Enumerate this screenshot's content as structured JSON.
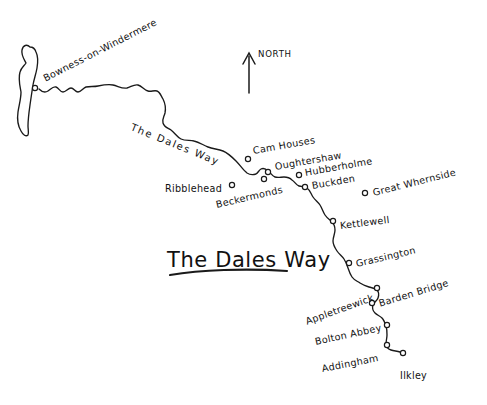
{
  "map": {
    "title": "The Dales Way",
    "route_name_on_path": "The Dales Way",
    "compass": {
      "label": "NORTH",
      "icon": "north-arrow-icon"
    },
    "style": {
      "ink_color": "#1a1a1a",
      "background_color": "#ffffff",
      "marker_fill": "#ffffff"
    },
    "water_features": [
      {
        "name": "Windermere",
        "shape": "elongated-lake-outline"
      }
    ],
    "places": [
      {
        "label": "Bowness-on-Windermere",
        "marker_x": 35,
        "marker_y": 88,
        "text_x": 44,
        "text_y": 74,
        "rotate": -27
      },
      {
        "label": "Cam Houses",
        "marker_x": 248,
        "marker_y": 159,
        "text_x": 253,
        "text_y": 146,
        "rotate": -10
      },
      {
        "label": "Oughtershaw",
        "marker_x": 268,
        "marker_y": 172,
        "text_x": 275,
        "text_y": 162,
        "rotate": -10
      },
      {
        "label": "Beckermonds",
        "marker_x": 264,
        "marker_y": 179,
        "text_x": 216,
        "text_y": 200,
        "rotate": -13
      },
      {
        "label": "Ribblehead",
        "marker_x": 232,
        "marker_y": 185,
        "text_x": 165,
        "text_y": 184,
        "rotate": 0
      },
      {
        "label": "Hubberholme",
        "marker_x": 299,
        "marker_y": 175,
        "text_x": 305,
        "text_y": 168,
        "rotate": -10
      },
      {
        "label": "Buckden",
        "marker_x": 305,
        "marker_y": 187,
        "text_x": 312,
        "text_y": 181,
        "rotate": -10
      },
      {
        "label": "Great Whernside",
        "marker_x": 365,
        "marker_y": 193,
        "text_x": 373,
        "text_y": 188,
        "rotate": -14
      },
      {
        "label": "Kettlewell",
        "marker_x": 333,
        "marker_y": 221,
        "text_x": 340,
        "text_y": 221,
        "rotate": -7
      },
      {
        "label": "Grassington",
        "marker_x": 349,
        "marker_y": 263,
        "text_x": 356,
        "text_y": 259,
        "rotate": -13
      },
      {
        "label": "Appletreewick",
        "marker_x": 377,
        "marker_y": 288,
        "text_x": 306,
        "text_y": 317,
        "rotate": -20
      },
      {
        "label": "Barden Bridge",
        "marker_x": 372,
        "marker_y": 303,
        "text_x": 379,
        "text_y": 299,
        "rotate": -17
      },
      {
        "label": "Bolton Abbey",
        "marker_x": 387,
        "marker_y": 325,
        "text_x": 315,
        "text_y": 337,
        "rotate": -12
      },
      {
        "label": "Addingham",
        "marker_x": 387,
        "marker_y": 345,
        "text_x": 322,
        "text_y": 364,
        "rotate": -11
      },
      {
        "label": "Ilkley",
        "marker_x": 403,
        "marker_y": 353,
        "text_x": 400,
        "text_y": 371,
        "rotate": 0
      }
    ]
  }
}
